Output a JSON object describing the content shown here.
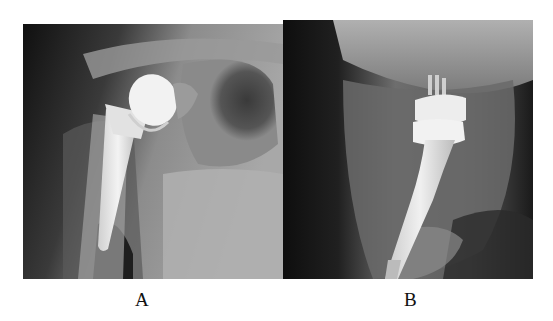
{
  "figure": {
    "panels": [
      {
        "id": "A",
        "label": "A",
        "description": "Anteroposterior shoulder radiograph showing humeral head prosthesis with intramedullary stem"
      },
      {
        "id": "B",
        "label": "B",
        "description": "Axillary/lateral shoulder radiograph showing humeral head prosthesis with stem"
      }
    ]
  },
  "colors": {
    "background": "#ffffff",
    "xray_dark": "#141414",
    "xray_mid": "#8a8a8a",
    "implant": "#eeeeee"
  }
}
